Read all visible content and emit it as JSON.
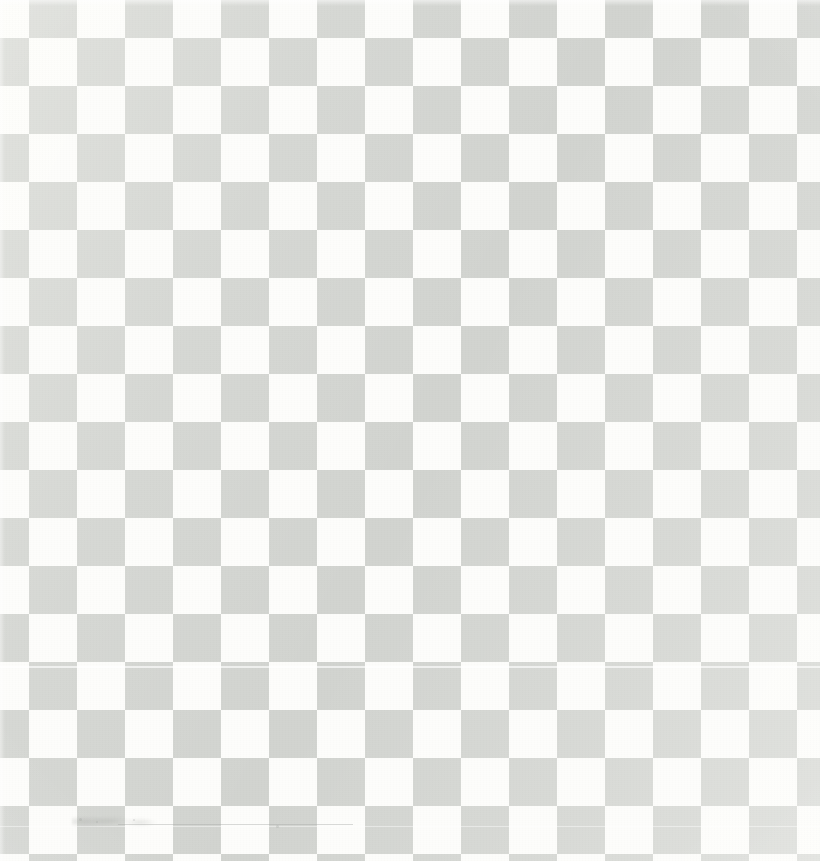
{
  "image": {
    "kind": "scanned-checkerboard-pattern",
    "description": "Scanned sheet showing a regular light-gray and white checkerboard grid",
    "width_px": 820,
    "height_px": 861,
    "alt_text": "Light gray and white checkerboard pattern filling the entire frame"
  },
  "pattern": {
    "type": "checkerboard",
    "cell_size_px": 48,
    "period_px": 96,
    "columns_visible": 17,
    "rows_visible": 18,
    "origin_offset_x_px": 29,
    "origin_offset_y_px": -10,
    "top_left_cell_color": "white",
    "edges": {
      "top_row_partial": true,
      "right_column_partial": true,
      "bottom_row_partial": true,
      "left_column_partial": false
    }
  },
  "colors": {
    "light_square": "#fdfdfb",
    "dark_square": "#d2d4d0",
    "dark_square_shadow": "#c9ccc7",
    "page_background": "#ffffff",
    "artifact_gray": "#a8aaa6"
  },
  "artifacts": {
    "scanlines": [
      {
        "name": "upper-scan-line",
        "y_px": 666,
        "height_px": 2,
        "opacity": 0.8
      },
      {
        "name": "lower-scan-line",
        "y_px": 826,
        "height_px": 1,
        "opacity": 0.55
      }
    ],
    "smudge": {
      "name": "dust-smudge",
      "x_px": 72,
      "y_px": 815,
      "width_px": 95,
      "height_px": 13
    },
    "smudge_line": {
      "name": "hairline-scratch",
      "x_px": 118,
      "y_px": 824,
      "width_px": 235,
      "height_px": 1
    },
    "specks": [
      {
        "name": "speck-a",
        "x_px": 79,
        "y_px": 818,
        "size_px": 3
      },
      {
        "name": "speck-b",
        "x_px": 96,
        "y_px": 821,
        "size_px": 2
      },
      {
        "name": "speck-c",
        "x_px": 133,
        "y_px": 819,
        "size_px": 2
      },
      {
        "name": "speck-d",
        "x_px": 276,
        "y_px": 825,
        "size_px": 3
      },
      {
        "name": "speck-e",
        "x_px": 700,
        "y_px": 132,
        "size_px": 2
      }
    ]
  }
}
